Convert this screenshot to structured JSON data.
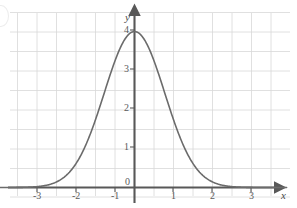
{
  "chart_data": {
    "type": "line",
    "title": "",
    "subtitle": "",
    "xlabel": "x",
    "ylabel": "y",
    "xlim": [
      -3.6,
      3.9
    ],
    "ylim": [
      -0.35,
      4.65
    ],
    "grid": true,
    "grid_step": 0.5,
    "legend": "none",
    "x_ticks": [
      -3,
      -2,
      -1,
      0,
      1,
      2,
      3
    ],
    "x_tick_labels": [
      "-3",
      "-2",
      "-1",
      "0",
      "1",
      "2",
      "3"
    ],
    "y_ticks": [
      1,
      2,
      3,
      4
    ],
    "y_tick_labels": [
      "1",
      "2",
      "3",
      "4"
    ],
    "series": [
      {
        "name": "bell-curve",
        "color": "#6b6b6b",
        "description": "Gaussian bell curve peaking at (0, 4), asymptotic to the x-axis",
        "peak": {
          "x": 0,
          "y": 4
        },
        "x": [
          -3.6,
          -3.4,
          -3.2,
          -3.0,
          -2.8,
          -2.6,
          -2.4,
          -2.2,
          -2.0,
          -1.8,
          -1.6,
          -1.4,
          -1.2,
          -1.0,
          -0.8,
          -0.6,
          -0.4,
          -0.2,
          0.0,
          0.2,
          0.4,
          0.6,
          0.8,
          1.0,
          1.2,
          1.4,
          1.6,
          1.8,
          2.0,
          2.2,
          2.4,
          2.6,
          2.8,
          3.0,
          3.2,
          3.4,
          3.6,
          3.8
        ],
        "values": [
          0.0007,
          0.0022,
          0.0061,
          0.0156,
          0.0366,
          0.0791,
          0.1572,
          0.2872,
          0.4824,
          0.7452,
          1.0584,
          1.3825,
          1.6607,
          1.8371,
          1.8708,
          1.7532,
          1.5128,
          1.2036,
          4.0,
          1.2036,
          1.5128,
          1.7532,
          1.8708,
          1.8371,
          1.6607,
          1.3825,
          1.0584,
          0.7452,
          0.4824,
          0.2872,
          0.1572,
          0.0791,
          0.0366,
          0.0156,
          0.0061,
          0.0022,
          0.0007,
          0.0002
        ],
        "formula": "y = 4 * exp(-x^2 / 1.2)"
      }
    ],
    "colors": {
      "curve": "#6b6b6b",
      "axis": "#585858",
      "grid": "#d8d8d8",
      "tick_text": "#5a5a5a",
      "background": "#ffffff"
    }
  },
  "axes": {
    "y_axis_label": "y",
    "x_axis_label": "x",
    "origin_label": "0"
  },
  "x_tick_labels": [
    "-3",
    "-2",
    "-1",
    "1",
    "2",
    "3"
  ],
  "y_tick_labels": [
    "4",
    "3",
    "2",
    "1"
  ]
}
